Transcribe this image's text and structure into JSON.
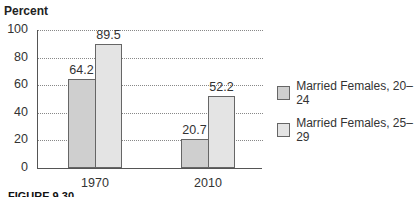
{
  "chart_data": {
    "type": "bar",
    "title": "",
    "ylabel": "Percent",
    "xlabel": "",
    "ylim": [
      0,
      100
    ],
    "yticks": [
      0,
      20,
      40,
      60,
      80,
      100
    ],
    "grid": true,
    "legend_position": "right",
    "categories": [
      "1970",
      "2010"
    ],
    "series": [
      {
        "name": "Married Females, 20–24",
        "values": [
          64.2,
          20.7
        ],
        "color": "#cfcfcf"
      },
      {
        "name": "Married Females, 25–29",
        "values": [
          89.5,
          52.2
        ],
        "color": "#e4e4e4"
      }
    ],
    "value_labels": [
      "64.2",
      "89.5",
      "20.7",
      "52.2"
    ]
  },
  "caption_fragment": "FIGURE 9.30"
}
